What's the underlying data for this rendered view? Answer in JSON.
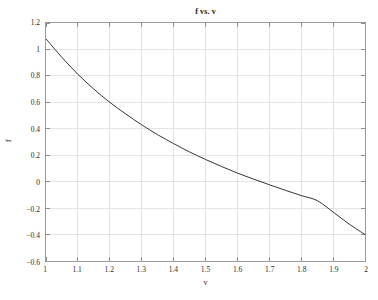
{
  "chart_data": {
    "type": "line",
    "title": "f vs. v",
    "xlabel": "v",
    "ylabel": "f",
    "xlim": [
      1,
      2
    ],
    "ylim": [
      -0.6,
      1.2
    ],
    "grid": true,
    "legend": null,
    "legend_position": "none",
    "xticks": [
      "1",
      "1.1",
      "1.2",
      "1.3",
      "1.4",
      "1.5",
      "1.6",
      "1.7",
      "1.8",
      "1.9",
      "2"
    ],
    "xtick_values": [
      1,
      1.1,
      1.2,
      1.3,
      1.4,
      1.5,
      1.6,
      1.7,
      1.8,
      1.9,
      2
    ],
    "yticks": [
      "1.2",
      "1",
      "0.8",
      "0.6",
      "0.4",
      "0.2",
      "0",
      "−0.2",
      "−0.4",
      "−0.6"
    ],
    "ytick_values": [
      1.2,
      1,
      0.8,
      0.6,
      0.4,
      0.2,
      0,
      -0.2,
      -0.4,
      -0.6
    ],
    "series": [
      {
        "name": "f",
        "color": "#333333",
        "x": [
          1.0,
          1.05,
          1.1,
          1.15,
          1.2,
          1.25,
          1.3,
          1.35,
          1.4,
          1.45,
          1.5,
          1.55,
          1.6,
          1.65,
          1.7,
          1.75,
          1.8,
          1.85,
          1.9,
          1.95,
          2.0
        ],
        "values": [
          1.08,
          0.94,
          0.812,
          0.7,
          0.6,
          0.512,
          0.43,
          0.355,
          0.288,
          0.225,
          0.168,
          0.115,
          0.065,
          0.02,
          -0.023,
          -0.065,
          -0.105,
          -0.143,
          -0.23,
          -0.32,
          -0.4
        ]
      }
    ]
  },
  "axes": {
    "frame_color": "#9a9a9a",
    "grid_color": "#e4e4e4",
    "tick_color": "#8c8c8c"
  }
}
